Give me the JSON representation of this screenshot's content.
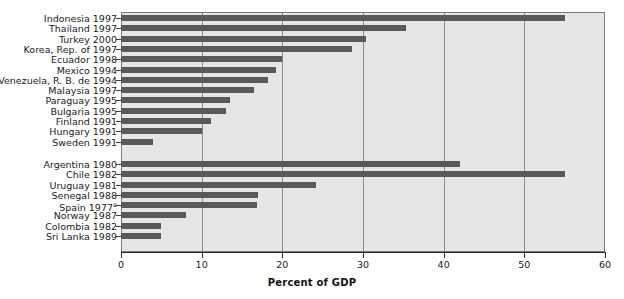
{
  "chart_data": {
    "type": "bar",
    "orientation": "horizontal",
    "title": "",
    "xlabel": "Percent of GDP",
    "ylabel": "",
    "xlim": [
      0,
      60
    ],
    "xticks": [
      0,
      10,
      20,
      30,
      40,
      50,
      60
    ],
    "xtick_labels": [
      "0",
      "10",
      "20",
      "30",
      "40",
      "50",
      "60"
    ],
    "grid": true,
    "grid_axis": "x",
    "legend": "none",
    "bar_color": "#595959",
    "plot_background": "#e6e6e6",
    "groups": [
      {
        "name": "recent-crises",
        "categories": [
          "Indonesia 1997",
          "Thailand 1997",
          "Turkey 2000",
          "Korea, Rep. of 1997",
          "Ecuador 1998",
          "Mexico 1994",
          "Venezuela, R. B. de 1994",
          "Malaysia 1997",
          "Paraguay 1995",
          "Bulgaria 1995",
          "Finland 1991",
          "Hungary 1991",
          "Sweden 1991"
        ],
        "values": [
          55.0,
          35.3,
          30.4,
          28.6,
          20.0,
          19.2,
          18.2,
          16.5,
          13.5,
          13.0,
          11.2,
          10.0,
          4.0
        ]
      },
      {
        "name": "earlier-crises",
        "categories": [
          "Argentina 1980",
          "Chile 1982",
          "Uruguay 1981",
          "Senegal 1988",
          "Spain 1977",
          "Norway 1987",
          "Colombia 1982",
          "Sri Lanka 1989"
        ],
        "category_footnotes": [
          "",
          "",
          "",
          "",
          "a",
          "",
          "",
          ""
        ],
        "values": [
          42.0,
          55.0,
          24.2,
          17.0,
          16.8,
          8.0,
          5.0,
          5.0
        ]
      }
    ]
  }
}
